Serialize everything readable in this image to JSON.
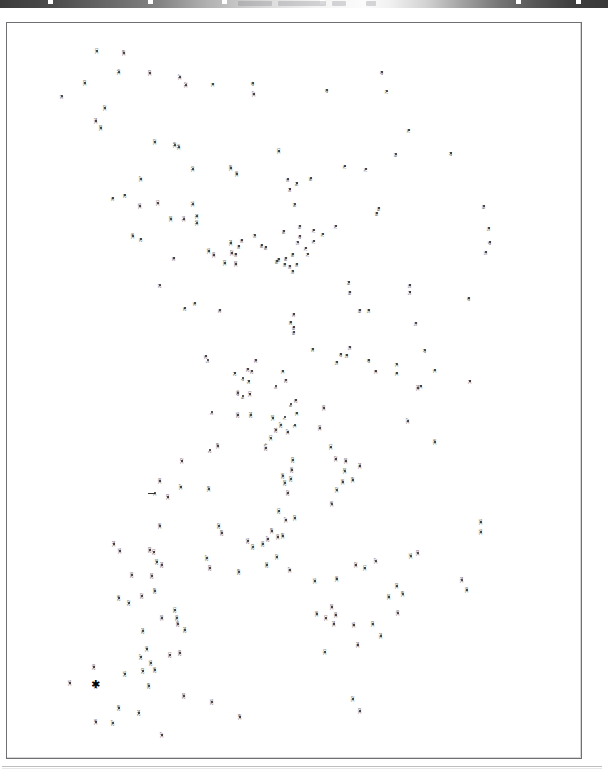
{
  "page": {
    "kind": "dot-to-dot-puzzle",
    "orientation": "portrait",
    "label_rotation_deg": -90,
    "dot_count": 250,
    "frame": {
      "x": 6,
      "y": 22,
      "width": 576,
      "height": 737,
      "border_color": "#6f6f74"
    },
    "colors": {
      "ink": "#1b1b1b",
      "label": "#202024",
      "paper": "#ffffff",
      "frame": "#6f6f74"
    },
    "scan_header": {
      "present": true,
      "legible": false,
      "description": "faded cut-off dark scan band across top edge"
    }
  },
  "markers": {
    "start_label": "star",
    "stars": [
      {
        "id": "star-1",
        "x": 89,
        "y": 91
      },
      {
        "id": "star-2",
        "x": 151,
        "y": 261
      },
      {
        "id": "star-3",
        "x": 89,
        "y": 663
      }
    ]
  },
  "chart_data": {
    "type": "scatter",
    "xlabel": "",
    "ylabel": "",
    "xlim": [
      0,
      576
    ],
    "ylim": [
      0,
      737
    ],
    "grid": false,
    "legend": "none",
    "point_label_mode": "sequence-number",
    "points": [
      {
        "n": "1",
        "x": 148,
        "y": 470
      },
      {
        "n": "2",
        "x": 203,
        "y": 427
      },
      {
        "n": "3",
        "x": 205,
        "y": 389
      },
      {
        "n": "4",
        "x": 236,
        "y": 355
      },
      {
        "n": "5",
        "x": 201,
        "y": 337
      },
      {
        "n": "6",
        "x": 236,
        "y": 373
      },
      {
        "n": "7",
        "x": 278,
        "y": 394
      },
      {
        "n": "8",
        "x": 284,
        "y": 381
      },
      {
        "n": "9",
        "x": 269,
        "y": 363
      },
      {
        "n": "10",
        "x": 290,
        "y": 390
      },
      {
        "n": "11",
        "x": 288,
        "y": 402
      },
      {
        "n": "12",
        "x": 206,
        "y": 61
      },
      {
        "n": "13",
        "x": 414,
        "y": 363
      },
      {
        "n": "14",
        "x": 463,
        "y": 358
      },
      {
        "n": "15",
        "x": 428,
        "y": 347
      },
      {
        "n": "16",
        "x": 390,
        "y": 350
      },
      {
        "n": "17",
        "x": 390,
        "y": 341
      },
      {
        "n": "18",
        "x": 369,
        "y": 348
      },
      {
        "n": "19",
        "x": 276,
        "y": 348
      },
      {
        "n": "20",
        "x": 289,
        "y": 377
      },
      {
        "n": "21",
        "x": 279,
        "y": 357
      },
      {
        "n": "22",
        "x": 241,
        "y": 346
      },
      {
        "n": "23",
        "x": 245,
        "y": 348
      },
      {
        "n": "24",
        "x": 228,
        "y": 350
      },
      {
        "n": "25",
        "x": 199,
        "y": 333
      },
      {
        "n": "26",
        "x": 178,
        "y": 285
      },
      {
        "n": "27",
        "x": 153,
        "y": 262
      },
      {
        "n": "28",
        "x": 118,
        "y": 172
      },
      {
        "n": "29",
        "x": 134,
        "y": 216
      },
      {
        "n": "30",
        "x": 167,
        "y": 235
      },
      {
        "n": "31",
        "x": 213,
        "y": 287
      },
      {
        "n": "32",
        "x": 249,
        "y": 337
      },
      {
        "n": "33",
        "x": 306,
        "y": 326
      },
      {
        "n": "34",
        "x": 242,
        "y": 358
      },
      {
        "n": "35",
        "x": 188,
        "y": 280
      },
      {
        "n": "36",
        "x": 106,
        "y": 175
      },
      {
        "n": "37",
        "x": 55,
        "y": 73
      },
      {
        "n": "38",
        "x": 284,
        "y": 299
      },
      {
        "n": "39",
        "x": 287,
        "y": 291
      },
      {
        "n": "40",
        "x": 246,
        "y": 60
      },
      {
        "n": "41",
        "x": 293,
        "y": 213
      },
      {
        "n": "41b",
        "x": 231,
        "y": 370
      },
      {
        "n": "42",
        "x": 320,
        "y": 67
      },
      {
        "n": "43",
        "x": 375,
        "y": 49
      },
      {
        "n": "44",
        "x": 444,
        "y": 130
      },
      {
        "n": "45",
        "x": 483,
        "y": 219
      },
      {
        "n": "46",
        "x": 462,
        "y": 275
      },
      {
        "n": "47",
        "x": 418,
        "y": 327
      },
      {
        "n": "48",
        "x": 362,
        "y": 337
      },
      {
        "n": "49",
        "x": 334,
        "y": 331
      },
      {
        "n": "50",
        "x": 340,
        "y": 332
      },
      {
        "n": "51",
        "x": 409,
        "y": 300
      },
      {
        "n": "52",
        "x": 343,
        "y": 324
      },
      {
        "n": "53",
        "x": 330,
        "y": 339
      },
      {
        "n": "54",
        "x": 403,
        "y": 269
      },
      {
        "n": "55",
        "x": 479,
        "y": 229
      },
      {
        "n": "56",
        "x": 403,
        "y": 262
      },
      {
        "n": "57",
        "x": 291,
        "y": 219
      },
      {
        "n": "58",
        "x": 362,
        "y": 287
      },
      {
        "n": "59",
        "x": 482,
        "y": 205
      },
      {
        "n": "60",
        "x": 353,
        "y": 287
      },
      {
        "n": "61",
        "x": 293,
        "y": 203
      },
      {
        "n": "62",
        "x": 343,
        "y": 269
      },
      {
        "n": "63",
        "x": 477,
        "y": 183
      },
      {
        "n": "64",
        "x": 342,
        "y": 259
      },
      {
        "n": "65",
        "x": 287,
        "y": 309
      },
      {
        "n": "66",
        "x": 287,
        "y": 304
      },
      {
        "n": "67",
        "x": 389,
        "y": 131
      },
      {
        "n": "68",
        "x": 370,
        "y": 190
      },
      {
        "n": "69",
        "x": 372,
        "y": 185
      },
      {
        "n": "70",
        "x": 402,
        "y": 107
      },
      {
        "n": "71",
        "x": 359,
        "y": 146
      },
      {
        "n": "72",
        "x": 316,
        "y": 211
      },
      {
        "n": "73",
        "x": 329,
        "y": 203
      },
      {
        "n": "74",
        "x": 301,
        "y": 231
      },
      {
        "n": "75",
        "x": 307,
        "y": 218
      },
      {
        "n": "76",
        "x": 338,
        "y": 143
      },
      {
        "n": "77",
        "x": 380,
        "y": 68
      },
      {
        "n": "78",
        "x": 307,
        "y": 207
      },
      {
        "n": "79",
        "x": 299,
        "y": 225
      },
      {
        "n": "80",
        "x": 286,
        "y": 231
      },
      {
        "n": "81",
        "x": 279,
        "y": 235
      },
      {
        "n": "82",
        "x": 270,
        "y": 238
      },
      {
        "n": "83",
        "x": 277,
        "y": 208
      },
      {
        "n": "84",
        "x": 290,
        "y": 160
      },
      {
        "n": "85",
        "x": 304,
        "y": 155
      },
      {
        "n": "86",
        "x": 255,
        "y": 222
      },
      {
        "n": "87",
        "x": 288,
        "y": 181
      },
      {
        "n": "88",
        "x": 272,
        "y": 236
      },
      {
        "n": "89",
        "x": 259,
        "y": 224
      },
      {
        "n": "90",
        "x": 278,
        "y": 241
      },
      {
        "n": "91",
        "x": 290,
        "y": 241
      },
      {
        "n": "92",
        "x": 283,
        "y": 243
      },
      {
        "n": "93",
        "x": 286,
        "y": 248
      },
      {
        "n": "94",
        "x": 283,
        "y": 166
      },
      {
        "n": "95",
        "x": 281,
        "y": 156
      },
      {
        "n": "96",
        "x": 235,
        "y": 217
      },
      {
        "n": "97",
        "x": 248,
        "y": 212
      },
      {
        "n": "98",
        "x": 229,
        "y": 231
      },
      {
        "n": "99",
        "x": 232,
        "y": 223
      },
      {
        "n": "100",
        "x": 229,
        "y": 241
      },
      {
        "n": "101",
        "x": 272,
        "y": 128
      },
      {
        "n": "102",
        "x": 225,
        "y": 230
      },
      {
        "n": "103",
        "x": 218,
        "y": 240
      },
      {
        "n": "104",
        "x": 224,
        "y": 220
      },
      {
        "n": "105",
        "x": 202,
        "y": 228
      },
      {
        "n": "106",
        "x": 230,
        "y": 151
      },
      {
        "n": "107",
        "x": 247,
        "y": 71
      },
      {
        "n": "108",
        "x": 224,
        "y": 145
      },
      {
        "n": "109",
        "x": 207,
        "y": 232
      },
      {
        "n": "110",
        "x": 190,
        "y": 200
      },
      {
        "n": "111",
        "x": 190,
        "y": 193
      },
      {
        "n": "112",
        "x": 179,
        "y": 62
      },
      {
        "n": "113",
        "x": 186,
        "y": 146
      },
      {
        "n": "114",
        "x": 177,
        "y": 196
      },
      {
        "n": "115",
        "x": 186,
        "y": 181
      },
      {
        "n": "116",
        "x": 172,
        "y": 124
      },
      {
        "n": "117",
        "x": 173,
        "y": 54
      },
      {
        "n": "118",
        "x": 168,
        "y": 122
      },
      {
        "n": "119",
        "x": 112,
        "y": 49
      },
      {
        "n": "120",
        "x": 164,
        "y": 196
      },
      {
        "n": "121",
        "x": 151,
        "y": 180
      },
      {
        "n": "122",
        "x": 148,
        "y": 119
      },
      {
        "n": "123",
        "x": 143,
        "y": 50
      },
      {
        "n": "124",
        "x": 411,
        "y": 365
      },
      {
        "n": "125",
        "x": 133,
        "y": 183
      },
      {
        "n": "126",
        "x": 126,
        "y": 213
      },
      {
        "n": "127",
        "x": 134,
        "y": 156
      },
      {
        "n": "128",
        "x": 117,
        "y": 30
      },
      {
        "n": "129",
        "x": 317,
        "y": 385
      },
      {
        "n": "130",
        "x": 94,
        "y": 105
      },
      {
        "n": "131",
        "x": 90,
        "y": 28
      },
      {
        "n": "132",
        "x": 98,
        "y": 85
      },
      {
        "n": "133",
        "x": 78,
        "y": 60
      },
      {
        "n": "134",
        "x": 89,
        "y": 98
      },
      {
        "n": "135",
        "x": 113,
        "y": 528
      },
      {
        "n": "136",
        "x": 153,
        "y": 503
      },
      {
        "n": "137",
        "x": 174,
        "y": 464
      },
      {
        "n": "138",
        "x": 211,
        "y": 423
      },
      {
        "n": "139",
        "x": 153,
        "y": 458
      },
      {
        "n": "140",
        "x": 266,
        "y": 395
      },
      {
        "n": "141",
        "x": 243,
        "y": 371
      },
      {
        "n": "142",
        "x": 175,
        "y": 438
      },
      {
        "n": "143",
        "x": 161,
        "y": 474
      },
      {
        "n": "144",
        "x": 107,
        "y": 521
      },
      {
        "n": "145",
        "x": 63,
        "y": 660
      },
      {
        "n": "146",
        "x": 89,
        "y": 699
      },
      {
        "n": "147",
        "x": 155,
        "y": 712
      },
      {
        "n": "148",
        "x": 233,
        "y": 694
      },
      {
        "n": "149",
        "x": 140,
        "y": 626
      },
      {
        "n": "150",
        "x": 155,
        "y": 595
      },
      {
        "n": "151",
        "x": 318,
        "y": 629
      },
      {
        "n": "152",
        "x": 346,
        "y": 676
      },
      {
        "n": "153",
        "x": 353,
        "y": 688
      },
      {
        "n": "154",
        "x": 374,
        "y": 613
      },
      {
        "n": "155",
        "x": 474,
        "y": 509
      },
      {
        "n": "156",
        "x": 428,
        "y": 419
      },
      {
        "n": "157",
        "x": 401,
        "y": 398
      },
      {
        "n": "158",
        "x": 202,
        "y": 466
      },
      {
        "n": "159",
        "x": 313,
        "y": 405
      },
      {
        "n": "160",
        "x": 339,
        "y": 438
      },
      {
        "n": "161",
        "x": 324,
        "y": 424
      },
      {
        "n": "162",
        "x": 329,
        "y": 436
      },
      {
        "n": "163",
        "x": 390,
        "y": 563
      },
      {
        "n": "164",
        "x": 353,
        "y": 443
      },
      {
        "n": "165",
        "x": 474,
        "y": 499
      },
      {
        "n": "166",
        "x": 336,
        "y": 459
      },
      {
        "n": "167",
        "x": 281,
        "y": 409
      },
      {
        "n": "168",
        "x": 346,
        "y": 457
      },
      {
        "n": "169",
        "x": 460,
        "y": 567
      },
      {
        "n": "170",
        "x": 338,
        "y": 448
      },
      {
        "n": "171",
        "x": 264,
        "y": 415
      },
      {
        "n": "172",
        "x": 330,
        "y": 467
      },
      {
        "n": "173",
        "x": 411,
        "y": 530
      },
      {
        "n": "174",
        "x": 455,
        "y": 557
      },
      {
        "n": "175",
        "x": 404,
        "y": 533
      },
      {
        "n": "176",
        "x": 325,
        "y": 481
      },
      {
        "n": "177",
        "x": 369,
        "y": 538
      },
      {
        "n": "178",
        "x": 396,
        "y": 571
      },
      {
        "n": "179",
        "x": 391,
        "y": 590
      },
      {
        "n": "180",
        "x": 382,
        "y": 574
      },
      {
        "n": "181",
        "x": 358,
        "y": 545
      },
      {
        "n": "182",
        "x": 349,
        "y": 542
      },
      {
        "n": "183",
        "x": 366,
        "y": 601
      },
      {
        "n": "184",
        "x": 351,
        "y": 622
      },
      {
        "n": "185",
        "x": 347,
        "y": 602
      },
      {
        "n": "186",
        "x": 330,
        "y": 556
      },
      {
        "n": "187",
        "x": 283,
        "y": 547
      },
      {
        "n": "188",
        "x": 276,
        "y": 513
      },
      {
        "n": "189",
        "x": 329,
        "y": 592
      },
      {
        "n": "190",
        "x": 325,
        "y": 584
      },
      {
        "n": "191",
        "x": 319,
        "y": 595
      },
      {
        "n": "192",
        "x": 270,
        "y": 534
      },
      {
        "n": "193",
        "x": 288,
        "y": 495
      },
      {
        "n": "194",
        "x": 327,
        "y": 601
      },
      {
        "n": "195",
        "x": 308,
        "y": 558
      },
      {
        "n": "196",
        "x": 310,
        "y": 591
      },
      {
        "n": "197",
        "x": 279,
        "y": 497
      },
      {
        "n": "198",
        "x": 265,
        "y": 508
      },
      {
        "n": "199",
        "x": 271,
        "y": 514
      },
      {
        "n": "200",
        "x": 260,
        "y": 542
      },
      {
        "n": "201",
        "x": 272,
        "y": 488
      },
      {
        "n": "202",
        "x": 281,
        "y": 470
      },
      {
        "n": "203",
        "x": 286,
        "y": 437
      },
      {
        "n": "204",
        "x": 244,
        "y": 392
      },
      {
        "n": "205",
        "x": 231,
        "y": 392
      },
      {
        "n": "206",
        "x": 285,
        "y": 447
      },
      {
        "n": "207",
        "x": 261,
        "y": 516
      },
      {
        "n": "207b",
        "x": 259,
        "y": 425
      },
      {
        "n": "208",
        "x": 215,
        "y": 510
      },
      {
        "n": "209",
        "x": 256,
        "y": 521
      },
      {
        "n": "210",
        "x": 278,
        "y": 460
      },
      {
        "n": "211",
        "x": 269,
        "y": 407
      },
      {
        "n": "212",
        "x": 284,
        "y": 456
      },
      {
        "n": "213",
        "x": 246,
        "y": 524
      },
      {
        "n": "214",
        "x": 136,
        "y": 608
      },
      {
        "n": "215",
        "x": 241,
        "y": 518
      },
      {
        "n": "216",
        "x": 276,
        "y": 453
      },
      {
        "n": "217",
        "x": 274,
        "y": 402
      },
      {
        "n": "218",
        "x": 232,
        "y": 549
      },
      {
        "n": "219",
        "x": 170,
        "y": 595
      },
      {
        "n": "220",
        "x": 177,
        "y": 673
      },
      {
        "n": "221",
        "x": 168,
        "y": 587
      },
      {
        "n": "222",
        "x": 212,
        "y": 503
      },
      {
        "n": "223",
        "x": 203,
        "y": 545
      },
      {
        "n": "224",
        "x": 178,
        "y": 607
      },
      {
        "n": "225",
        "x": 205,
        "y": 679
      },
      {
        "n": "226",
        "x": 171,
        "y": 601
      },
      {
        "n": "227",
        "x": 200,
        "y": 535
      },
      {
        "n": "228",
        "x": 148,
        "y": 568
      },
      {
        "n": "229",
        "x": 173,
        "y": 630
      },
      {
        "n": "230",
        "x": 145,
        "y": 553
      },
      {
        "n": "231",
        "x": 163,
        "y": 632
      },
      {
        "n": "232",
        "x": 135,
        "y": 573
      },
      {
        "n": "233",
        "x": 143,
        "y": 527
      },
      {
        "n": "234",
        "x": 155,
        "y": 542
      },
      {
        "n": "235",
        "x": 144,
        "y": 640
      },
      {
        "n": "236",
        "x": 148,
        "y": 647
      },
      {
        "n": "237",
        "x": 106,
        "y": 700
      },
      {
        "n": "238",
        "x": 142,
        "y": 663
      },
      {
        "n": "239",
        "x": 125,
        "y": 552
      },
      {
        "n": "240",
        "x": 150,
        "y": 539
      },
      {
        "n": "241",
        "x": 147,
        "y": 529
      },
      {
        "n": "242",
        "x": 122,
        "y": 580
      },
      {
        "n": "243",
        "x": 136,
        "y": 648
      },
      {
        "n": "244",
        "x": 132,
        "y": 690
      },
      {
        "n": "245",
        "x": 118,
        "y": 651
      },
      {
        "n": "246",
        "x": 112,
        "y": 575
      },
      {
        "n": "247",
        "x": 134,
        "y": 634
      },
      {
        "n": "248",
        "x": 112,
        "y": 685
      },
      {
        "n": "249",
        "x": 87,
        "y": 644
      },
      {
        "n": "250",
        "x": 89,
        "y": 663
      }
    ]
  }
}
